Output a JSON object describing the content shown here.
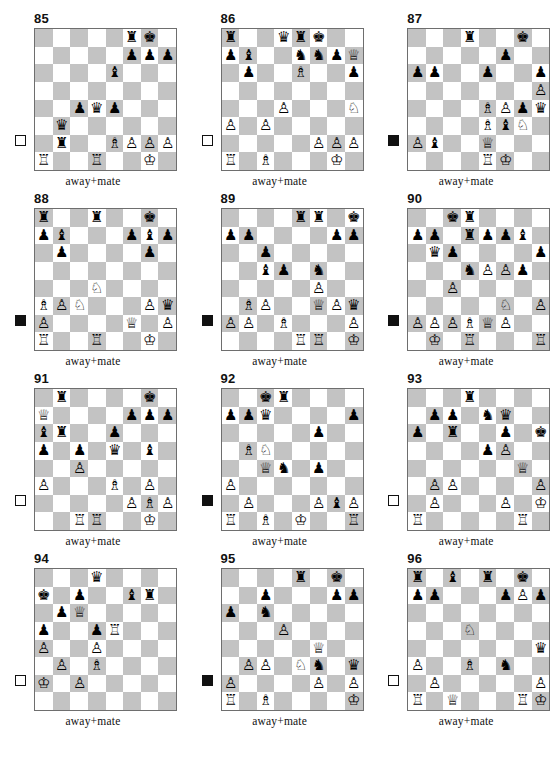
{
  "page": {
    "caption_text": "away+mate",
    "colors": {
      "dark_square": "#c3c3c3",
      "light_square": "#ffffff",
      "border": "#6e6e6e",
      "text": "#111111"
    }
  },
  "glyphs": {
    "wK": "♔",
    "wQ": "♕",
    "wR": "♖",
    "wB": "♗",
    "wN": "♘",
    "wP": "♙",
    "bK": "♚",
    "bQ": "♛",
    "bR": "♜",
    "bB": "♝",
    "bN": "♞",
    "bP": "♟"
  },
  "puzzles": [
    {
      "number": "85",
      "side_to_move": "white",
      "caption": "away+mate",
      "pieces": {
        "f8": "bR",
        "g8": "bK",
        "f7": "bP",
        "g7": "bP",
        "h7": "bP",
        "e6": "bB",
        "c4": "bP",
        "d4": "bQ",
        "e4": "bP",
        "b3": "bQ",
        "b2": "bR",
        "e2": "wB",
        "f2": "wP",
        "g2": "wP",
        "h2": "wP",
        "a1": "wR",
        "d1": "wR",
        "g1": "wK"
      }
    },
    {
      "number": "86",
      "side_to_move": "white",
      "caption": "away+mate",
      "pieces": {
        "a8": "bR",
        "d8": "bQ",
        "e8": "bR",
        "f8": "bK",
        "a7": "bP",
        "b7": "bB",
        "e7": "bN",
        "f7": "bN",
        "g7": "bP",
        "h7": "wQ",
        "b6": "bP",
        "e6": "wB",
        "h6": "bP",
        "d4": "wP",
        "h4": "wN",
        "a3": "wP",
        "c3": "wP",
        "f2": "wP",
        "g2": "wP",
        "h2": "wP",
        "a1": "wR",
        "c1": "wB",
        "g1": "wK"
      }
    },
    {
      "number": "87",
      "side_to_move": "black",
      "caption": "away+mate",
      "pieces": {
        "d8": "bR",
        "g8": "bK",
        "f7": "bP",
        "a6": "bP",
        "b6": "bP",
        "e6": "bP",
        "h6": "bP",
        "h5": "wP",
        "e4": "wB",
        "f4": "wP",
        "g4": "bP",
        "h4": "bQ",
        "e3": "wB",
        "f3": "bB",
        "g3": "wN",
        "a2": "wP",
        "b2": "bB",
        "e2": "wQ",
        "e1": "wR",
        "f1": "wK"
      }
    },
    {
      "number": "88",
      "side_to_move": "black",
      "caption": "away+mate",
      "pieces": {
        "a8": "bR",
        "d8": "bR",
        "g8": "bK",
        "a7": "bP",
        "b7": "bB",
        "f7": "bP",
        "g7": "bB",
        "h7": "bP",
        "b6": "bP",
        "g6": "bP",
        "d4": "wN",
        "a3": "wB",
        "b3": "wP",
        "c3": "wN",
        "g3": "wP",
        "h3": "bQ",
        "a2": "wP",
        "f2": "wQ",
        "h2": "wP",
        "a1": "wR",
        "d1": "wR",
        "g1": "wK"
      }
    },
    {
      "number": "89",
      "side_to_move": "black",
      "caption": "away+mate",
      "pieces": {
        "e8": "bR",
        "f8": "bR",
        "h8": "bK",
        "a7": "bP",
        "b7": "bP",
        "g7": "bP",
        "h7": "bP",
        "c6": "bP",
        "c5": "bB",
        "d5": "bP",
        "f5": "bN",
        "f4": "wP",
        "b3": "wB",
        "c3": "wP",
        "f3": "wQ",
        "g3": "wP",
        "h3": "bQ",
        "a2": "wP",
        "b2": "wP",
        "d2": "wB",
        "h2": "wP",
        "e1": "wR",
        "f1": "wR",
        "h1": "wK"
      }
    },
    {
      "number": "90",
      "side_to_move": "black",
      "caption": "away+mate",
      "pieces": {
        "c8": "bK",
        "d8": "bR",
        "a7": "bP",
        "b7": "bP",
        "d7": "bR",
        "e7": "bP",
        "f7": "bP",
        "g7": "bB",
        "b6": "bQ",
        "c6": "bP",
        "h6": "bP",
        "d5": "bN",
        "e5": "wP",
        "f5": "wP",
        "g5": "bP",
        "c4": "wP",
        "f3": "wN",
        "h3": "wP",
        "a2": "wP",
        "b2": "wP",
        "c2": "wP",
        "d2": "wB",
        "e2": "wQ",
        "f2": "wP",
        "b1": "wK",
        "d1": "wR",
        "h1": "wR"
      }
    },
    {
      "number": "91",
      "side_to_move": "white",
      "caption": "away+mate",
      "pieces": {
        "b8": "bR",
        "g8": "bK",
        "a7": "wQ",
        "f7": "bP",
        "g7": "bP",
        "h7": "bP",
        "a6": "bB",
        "b6": "bR",
        "e6": "bP",
        "a5": "bP",
        "c5": "bP",
        "e5": "bQ",
        "g5": "bB",
        "c4": "wP",
        "a3": "wP",
        "e3": "wB",
        "g3": "wP",
        "f2": "wP",
        "g2": "wB",
        "h2": "wP",
        "c1": "wR",
        "d1": "wR",
        "g1": "wK"
      }
    },
    {
      "number": "92",
      "side_to_move": "black",
      "caption": "away+mate",
      "pieces": {
        "c8": "bK",
        "d8": "bR",
        "a7": "bP",
        "b7": "bP",
        "c7": "bQ",
        "h7": "bP",
        "f6": "bP",
        "b5": "wB",
        "c5": "wN",
        "c4": "wQ",
        "d4": "bN",
        "f4": "bP",
        "a3": "wP",
        "b2": "wP",
        "f2": "wP",
        "g2": "bB",
        "h2": "wP",
        "a1": "wR",
        "c1": "wB",
        "e1": "wK",
        "h1": "wR"
      }
    },
    {
      "number": "93",
      "side_to_move": "white",
      "caption": "away+mate",
      "pieces": {
        "d8": "bR",
        "b7": "bP",
        "c7": "bP",
        "e7": "bN",
        "f7": "bQ",
        "a6": "bP",
        "c6": "bR",
        "f6": "bP",
        "h6": "bK",
        "e5": "bP",
        "f5": "wP",
        "g4": "wQ",
        "b3": "wP",
        "c3": "wP",
        "h3": "wP",
        "b2": "wP",
        "f2": "wP",
        "h2": "wK",
        "a1": "wR",
        "g1": "wR"
      }
    },
    {
      "number": "94",
      "side_to_move": "white",
      "caption": "away+mate",
      "pieces": {
        "d8": "bQ",
        "a7": "bK",
        "c7": "bP",
        "f7": "bB",
        "g7": "bR",
        "b6": "bP",
        "c6": "wQ",
        "a5": "bP",
        "d5": "bP",
        "e5": "wR",
        "a4": "wP",
        "d4": "wP",
        "b3": "wP",
        "d3": "wB",
        "a2": "wK",
        "c2": "wP"
      }
    },
    {
      "number": "95",
      "side_to_move": "black",
      "caption": "away+mate",
      "pieces": {
        "e8": "bR",
        "g8": "bK",
        "c7": "bP",
        "g7": "bP",
        "h7": "bP",
        "a6": "bP",
        "c6": "bN",
        "d5": "wP",
        "f4": "wQ",
        "b3": "wP",
        "c3": "wP",
        "e3": "wN",
        "f3": "bN",
        "h3": "bQ",
        "a2": "wP",
        "f2": "wP",
        "h2": "wP",
        "a1": "wR",
        "c1": "wB",
        "h1": "wK"
      }
    },
    {
      "number": "96",
      "side_to_move": "white",
      "caption": "away+mate",
      "pieces": {
        "a8": "bR",
        "c8": "bB",
        "e8": "bR",
        "g8": "bK",
        "a7": "bP",
        "b7": "bP",
        "f7": "bP",
        "g7": "wP",
        "h7": "bP",
        "d5": "wN",
        "h4": "bQ",
        "a3": "wP",
        "d3": "wB",
        "f3": "bN",
        "b2": "wP",
        "h2": "wP",
        "a1": "wR",
        "c1": "wQ",
        "g1": "wR",
        "h1": "wK"
      }
    }
  ]
}
